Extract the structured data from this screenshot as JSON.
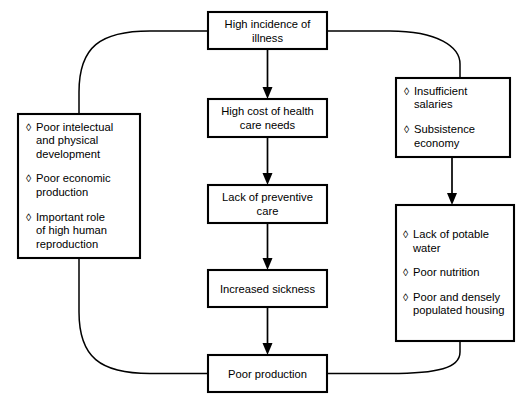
{
  "diagram": {
    "bullet_glyph": "◊",
    "line_color": "#000000",
    "box_fill": "#ffffff",
    "nodes": {
      "illness": {
        "label_lines": [
          "High incidence of",
          "illness"
        ]
      },
      "health_cost": {
        "label_lines": [
          "High cost of health",
          "care needs"
        ]
      },
      "preventive": {
        "label_lines": [
          "Lack of preventive",
          "care"
        ]
      },
      "sickness": {
        "label_lines": [
          "Increased sickness"
        ]
      },
      "production": {
        "label_lines": [
          "Poor production"
        ]
      },
      "development": {
        "items": [
          [
            "Poor intelectual",
            "and physical",
            "development"
          ],
          [
            "Poor economic",
            "production"
          ],
          [
            "Important role",
            "of high human",
            "reproduction"
          ]
        ]
      },
      "income": {
        "items": [
          [
            "Insufficient",
            "salaries"
          ],
          [
            "Subsistence",
            "economy"
          ]
        ]
      },
      "living": {
        "items": [
          [
            "Lack of potable",
            "water"
          ],
          [
            "Poor nutrition"
          ],
          [
            "Poor and densely",
            "populated housing"
          ]
        ]
      }
    }
  }
}
